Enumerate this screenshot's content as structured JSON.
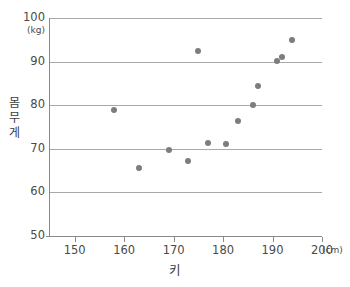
{
  "chart_data": {
    "type": "scatter",
    "title": "",
    "xlabel": "키",
    "ylabel": "몸무게",
    "x_unit": "(cm)",
    "y_unit": "(kg)",
    "xlim": [
      145,
      200
    ],
    "ylim": [
      50,
      100
    ],
    "x_ticks": [
      150,
      160,
      170,
      180,
      190,
      200
    ],
    "y_ticks": [
      50,
      60,
      70,
      80,
      90,
      100
    ],
    "x_tick_labels": [
      "150",
      "160",
      "170",
      "180",
      "190",
      "200"
    ],
    "y_tick_labels": [
      "50",
      "60",
      "70",
      "80",
      "90",
      "100"
    ],
    "grid": "horizontal",
    "legend": "none",
    "marker_color": "#7d7d7d",
    "grid_color": "#a8a8a8",
    "axis_color": "#8a8a8a",
    "points": [
      {
        "x": 158.0,
        "y": 78.8
      },
      {
        "x": 163.0,
        "y": 65.5
      },
      {
        "x": 169.0,
        "y": 69.7
      },
      {
        "x": 173.0,
        "y": 67.3
      },
      {
        "x": 175.0,
        "y": 92.5
      },
      {
        "x": 177.0,
        "y": 71.3
      },
      {
        "x": 180.5,
        "y": 71.0
      },
      {
        "x": 183.0,
        "y": 76.4
      },
      {
        "x": 186.0,
        "y": 80.0
      },
      {
        "x": 187.0,
        "y": 84.5
      },
      {
        "x": 191.0,
        "y": 90.2
      },
      {
        "x": 192.0,
        "y": 91.0
      },
      {
        "x": 194.0,
        "y": 95.0
      }
    ]
  },
  "axis_titles": {
    "y_chars": [
      "몸",
      "무",
      "게"
    ],
    "x": "키"
  }
}
